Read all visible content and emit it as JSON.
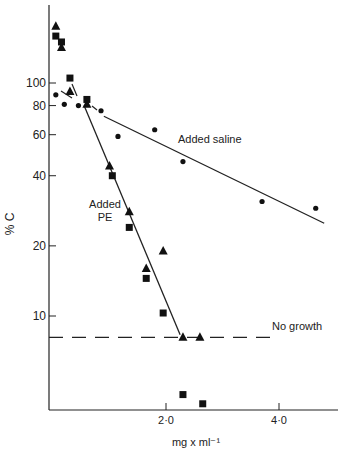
{
  "chart_data": {
    "type": "scatter",
    "title": "",
    "xlabel": "mg x ml⁻¹",
    "ylabel": "% C",
    "yscale": "log",
    "xlim": [
      0,
      5.0
    ],
    "ylim": [
      5,
      200
    ],
    "x_ticks": [
      {
        "value": 2.0,
        "label": "2·0"
      },
      {
        "value": 4.0,
        "label": "4·0"
      }
    ],
    "y_ticks": [
      {
        "value": 100,
        "label": "100"
      },
      {
        "value": 80,
        "label": "80"
      },
      {
        "value": 60,
        "label": "60"
      },
      {
        "value": 40,
        "label": "40"
      },
      {
        "value": 20,
        "label": "20"
      },
      {
        "value": 10,
        "label": "10"
      }
    ],
    "grid": false,
    "annotations": [
      {
        "text": "Added saline",
        "x": 2.6,
        "y": 68
      },
      {
        "text": "Added PE",
        "x": 1.05,
        "y": 30
      },
      {
        "text": "No growth",
        "x": 4.3,
        "y": 9
      }
    ],
    "series": [
      {
        "name": "Added PE (triangles)",
        "marker": "triangle",
        "x": [
          0.05,
          0.15,
          0.3,
          0.6,
          1.0,
          1.35,
          1.65,
          1.95,
          2.3,
          2.6
        ],
        "y": [
          175,
          142,
          92,
          81,
          44,
          28,
          16,
          19,
          8.1,
          8.1
        ]
      },
      {
        "name": "Added PE (squares)",
        "marker": "square",
        "x": [
          0.05,
          0.15,
          0.3,
          0.6,
          1.05,
          1.35,
          1.65,
          1.95,
          2.3,
          2.65
        ],
        "y": [
          159,
          150,
          105,
          85,
          40,
          24,
          14.5,
          10.3,
          4.6,
          4.2
        ]
      },
      {
        "name": "Added saline",
        "marker": "circle",
        "x": [
          0.05,
          0.2,
          0.45,
          0.85,
          1.15,
          1.8,
          2.3,
          3.7,
          4.65
        ],
        "y": [
          89,
          81,
          80,
          76,
          59,
          63,
          46,
          31,
          29
        ]
      }
    ],
    "fit_lines": [
      {
        "name": "Added saline fit",
        "from": [
          0.9,
          72
        ],
        "to": [
          4.8,
          25
        ]
      },
      {
        "name": "Added PE fit",
        "from": [
          0.55,
          80
        ],
        "to": [
          2.25,
          8.3
        ]
      },
      {
        "name": "No growth",
        "style": "dashed",
        "y": 8.1,
        "from_x": 0,
        "to_x": 4.0
      }
    ]
  }
}
